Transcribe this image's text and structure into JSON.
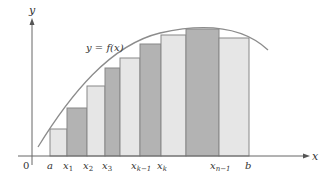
{
  "figure": {
    "curve_label": "y = f(x)",
    "axis_x_label": "x",
    "axis_y_label": "y",
    "origin_label": "0",
    "tick_labels": [
      {
        "main": "a",
        "sub": ""
      },
      {
        "main": "x",
        "sub": "1"
      },
      {
        "main": "x",
        "sub": "2"
      },
      {
        "main": "x",
        "sub": "3"
      },
      {
        "main": "x",
        "sub": "k−1"
      },
      {
        "main": "x",
        "sub": "k"
      },
      {
        "main": "x",
        "sub": "n−1"
      },
      {
        "main": "b",
        "sub": ""
      }
    ],
    "colors": {
      "light_rect": "#e6e6e6",
      "dark_rect": "#b3b3b3",
      "rect_stroke": "#888888",
      "curve": "#8c8c8c",
      "axis": "#666666"
    }
  }
}
